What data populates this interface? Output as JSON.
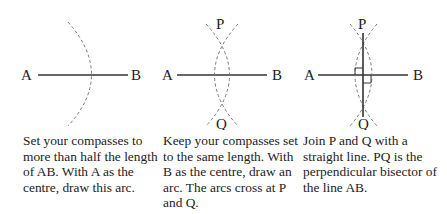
{
  "panels": [
    {
      "labels": {
        "a": "A",
        "b": "B"
      },
      "caption": "Set your compasses to more than half the length of AB. With A as the centre, draw this arc."
    },
    {
      "labels": {
        "a": "A",
        "b": "B",
        "p": "P",
        "q": "Q"
      },
      "caption": "Keep your compasses set to the same length. With B as the centre, draw an arc. The arcs cross at P and Q."
    },
    {
      "labels": {
        "a": "A",
        "b": "B",
        "p": "P",
        "q": "Q"
      },
      "caption": "Join P and Q with a straight line. PQ is the perpendicular bisector of the line AB."
    }
  ]
}
